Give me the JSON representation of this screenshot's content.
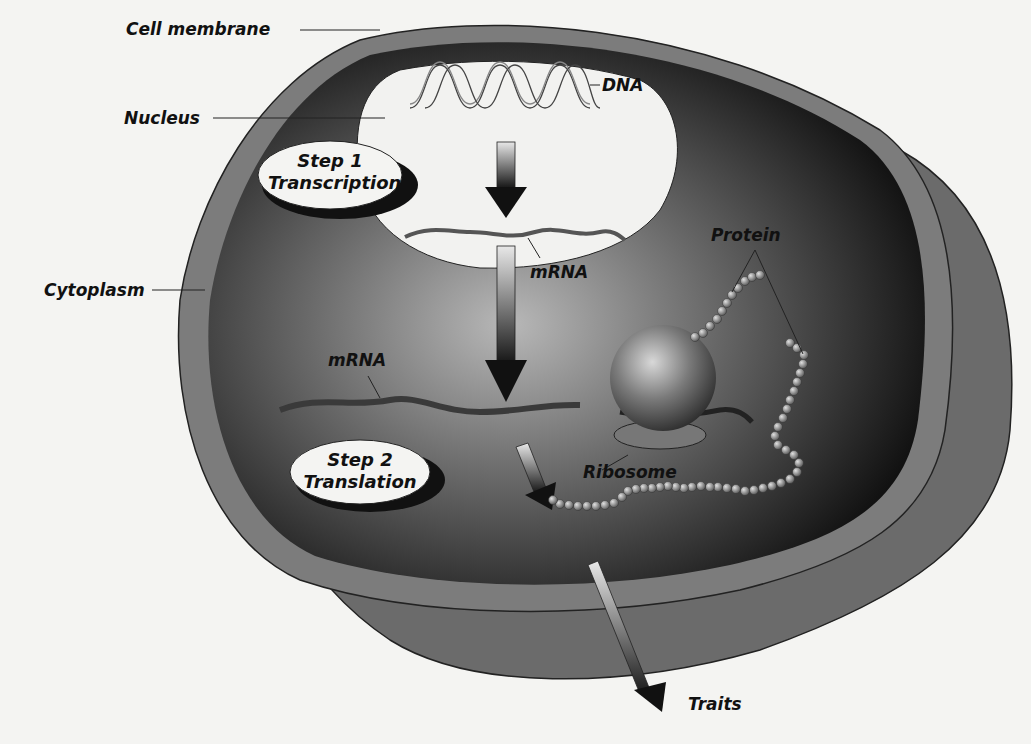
{
  "labels": {
    "cell_membrane": "Cell membrane",
    "nucleus": "Nucleus",
    "dna": "DNA",
    "mrna_nucleus": "mRNA",
    "cytoplasm": "Cytoplasm",
    "mrna_cytoplasm": "mRNA",
    "protein": "Protein",
    "ribosome": "Ribosome",
    "traits": "Traits"
  },
  "steps": [
    {
      "title": "Step 1",
      "name": "Transcription"
    },
    {
      "title": "Step 2",
      "name": "Translation"
    }
  ]
}
